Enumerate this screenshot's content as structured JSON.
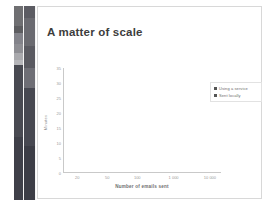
{
  "slide": {
    "title": "A matter of scale"
  },
  "sidebar": {
    "name": "slide-thumbnail-strip",
    "strip_a": [
      {
        "color": "#6f6f72",
        "height": 21
      },
      {
        "color": "#5d5d60",
        "height": 7
      },
      {
        "color": "#83838a",
        "height": 11
      },
      {
        "color": "#8e8e93",
        "height": 9
      },
      {
        "color": "#a9a9ad",
        "height": 8
      },
      {
        "color": "#b6b6ba",
        "height": 5
      },
      {
        "color": "#494a52",
        "height": 74
      },
      {
        "color": "#3f4049",
        "height": 65
      }
    ],
    "strip_b": [
      {
        "color": "#5c5c63",
        "height": 12
      },
      {
        "color": "#6a6a70",
        "height": 28
      },
      {
        "color": "#5a5a61",
        "height": 22
      },
      {
        "color": "#6e6e75",
        "height": 20
      },
      {
        "color": "#474851",
        "height": 58
      },
      {
        "color": "#3c3d46",
        "height": 54
      }
    ]
  },
  "chart_data": {
    "type": "line",
    "title": "A matter of scale",
    "xlabel": "Number of emails sent",
    "ylabel": "Minutes",
    "x_scale": "log",
    "x_ticks": [
      "20",
      "50",
      "100",
      "1 000",
      "10 000"
    ],
    "x_tick_positions": [
      0.09,
      0.28,
      0.47,
      0.7,
      0.93
    ],
    "y_ticks": [
      "35",
      "30",
      "25",
      "20",
      "15",
      "10",
      "5",
      "0"
    ],
    "ylim": [
      0,
      35
    ],
    "grid": false,
    "legend_position": "right",
    "series": [
      {
        "name": "Using a service",
        "color": "#4b4b4b",
        "values": []
      },
      {
        "name": "Sent locally",
        "color": "#4b4b4b",
        "values": []
      }
    ],
    "note": "Plot area is empty - no data series rendered in this frame"
  },
  "legend": {
    "items": [
      {
        "label": "Using a service",
        "color": "#555555"
      },
      {
        "label": "Sent locally",
        "color": "#555555"
      }
    ]
  }
}
